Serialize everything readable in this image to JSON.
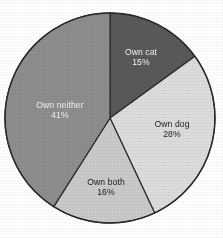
{
  "chart_data": {
    "type": "pie",
    "title": "",
    "subtitle": "",
    "xlabel": "",
    "ylabel": "",
    "legend_position": "none",
    "grid": false,
    "labels_inside_slices": true,
    "start_angle_deg": 0,
    "direction": "clockwise",
    "categories": [
      "Own cat",
      "Own dog",
      "Own both",
      "Own neither"
    ],
    "values": [
      15,
      28,
      16,
      41
    ],
    "value_unit": "%",
    "slices": [
      {
        "name": "Own cat",
        "value": 15,
        "value_text": "15%",
        "color": "#595959",
        "label_color": "#f2f2f2",
        "start_deg": 0,
        "end_deg": 54
      },
      {
        "name": "Own dog",
        "value": 28,
        "value_text": "28%",
        "color": "#dcdcdc",
        "label_color": "#1a1a1a",
        "start_deg": 54,
        "end_deg": 154.8
      },
      {
        "name": "Own both",
        "value": 16,
        "value_text": "16%",
        "color": "#c9c9c9",
        "label_color": "#1a1a1a",
        "start_deg": 154.8,
        "end_deg": 212.4
      },
      {
        "name": "Own neither",
        "value": 41,
        "value_text": "41%",
        "color": "#8d8d8d",
        "label_color": "#f2f2f2",
        "start_deg": 212.4,
        "end_deg": 360
      }
    ],
    "geometry": {
      "center_x": 110,
      "center_y": 118,
      "radius": 105,
      "outline_color": "#2a2a2a",
      "background": "#ffffff"
    }
  }
}
